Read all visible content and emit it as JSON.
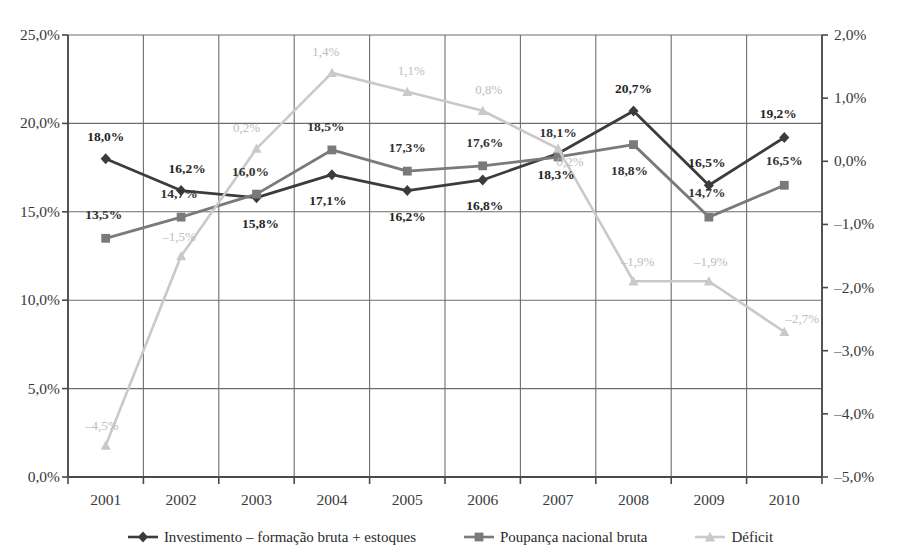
{
  "chart_data": {
    "type": "line",
    "title": "",
    "subtitle": "",
    "xlabel": "",
    "ylabel": "",
    "grid": true,
    "legend_position": "bottom",
    "categories": [
      "2001",
      "2002",
      "2003",
      "2004",
      "2005",
      "2006",
      "2007",
      "2008",
      "2009",
      "2010"
    ],
    "axes": {
      "left": {
        "ylim": [
          0,
          25
        ],
        "ticks": [
          0,
          5,
          10,
          15,
          20,
          25
        ],
        "ticklabels": [
          "0,0%",
          "5,0%",
          "10,0%",
          "15,0%",
          "20,0%",
          "25,0%"
        ]
      },
      "right": {
        "ylim": [
          -5,
          2
        ],
        "ticks": [
          -5,
          -4,
          -3,
          -2,
          -1,
          0,
          1,
          2
        ],
        "ticklabels": [
          "–5,0%",
          "–4,0%",
          "–3,0%",
          "–2,0%",
          "–1,0%",
          "0,0%",
          "1,0%",
          "2,0%"
        ]
      }
    },
    "series": [
      {
        "name": "Investimento – formação bruta + estoques",
        "axis": "left",
        "color": "#3c3c3c",
        "marker": "diamond",
        "values": [
          18.0,
          16.2,
          15.8,
          17.1,
          16.2,
          16.8,
          18.3,
          20.7,
          16.5,
          19.2
        ],
        "labels": [
          "18,0%",
          "16,2%",
          "15,8%",
          "17,1%",
          "16,2%",
          "16,8%",
          "18,3%",
          "20,7%",
          "16,5%",
          "19,2%"
        ],
        "label_offsets": [
          {
            "dx": 0,
            "dy": -22
          },
          {
            "dx": 6,
            "dy": -22
          },
          {
            "dx": 4,
            "dy": 26
          },
          {
            "dx": -4,
            "dy": 26
          },
          {
            "dx": 0,
            "dy": 26
          },
          {
            "dx": 2,
            "dy": 26
          },
          {
            "dx": -2,
            "dy": 22
          },
          {
            "dx": 0,
            "dy": -22
          },
          {
            "dx": -2,
            "dy": -22
          },
          {
            "dx": -6,
            "dy": -24
          }
        ]
      },
      {
        "name": "Poupança nacional bruta",
        "axis": "left",
        "color": "#7a7a7a",
        "marker": "square",
        "values": [
          13.5,
          14.7,
          16.0,
          18.5,
          17.3,
          17.6,
          18.1,
          18.8,
          14.7,
          16.5
        ],
        "labels": [
          "13,5%",
          "14,7%",
          "16,0%",
          "18,5%",
          "17,3%",
          "17,6%",
          "18,1%",
          "18,8%",
          "14,7%",
          "16,5%"
        ],
        "label_offsets": [
          {
            "dx": -2,
            "dy": -23
          },
          {
            "dx": -2,
            "dy": -23
          },
          {
            "dx": -6,
            "dy": -22
          },
          {
            "dx": -6,
            "dy": -23
          },
          {
            "dx": 0,
            "dy": -23
          },
          {
            "dx": 2,
            "dy": -23
          },
          {
            "dx": 0,
            "dy": -24
          },
          {
            "dx": -4,
            "dy": 26
          },
          {
            "dx": -2,
            "dy": -24
          },
          {
            "dx": 0,
            "dy": -24
          }
        ]
      },
      {
        "name": "Déficit",
        "axis": "right",
        "color": "#c9c9c9",
        "marker": "triangle",
        "values": [
          -4.5,
          -1.5,
          0.2,
          1.4,
          1.1,
          0.8,
          0.2,
          -1.9,
          -1.9,
          -2.7
        ],
        "labels": [
          "–4,5%",
          "–1,5%",
          "0,2%",
          "1,4%",
          "1,1%",
          "0,8%",
          "0,2%",
          "–1,9%",
          "–1,9%",
          "–2,7%"
        ],
        "label_offsets": [
          {
            "dx": -4,
            "dy": -20
          },
          {
            "dx": -2,
            "dy": -20
          },
          {
            "dx": -10,
            "dy": -22
          },
          {
            "dx": -6,
            "dy": -22
          },
          {
            "dx": 4,
            "dy": -22
          },
          {
            "dx": 6,
            "dy": -22
          },
          {
            "dx": 12,
            "dy": 12
          },
          {
            "dx": 4,
            "dy": -20
          },
          {
            "dx": 2,
            "dy": -20
          },
          {
            "dx": 18,
            "dy": -14
          }
        ]
      }
    ]
  },
  "legend": {
    "items": [
      {
        "label": "Investimento – formação bruta + estoques",
        "marker": "diamond",
        "color": "#3c3c3c"
      },
      {
        "label": "Poupança nacional bruta",
        "marker": "square",
        "color": "#7a7a7a"
      },
      {
        "label": "Déficit",
        "marker": "triangle",
        "color": "#c9c9c9"
      }
    ]
  },
  "style": {
    "axis_color": "#4a4a4a",
    "grid_color": "#6d6d6d",
    "background": "#ffffff"
  }
}
